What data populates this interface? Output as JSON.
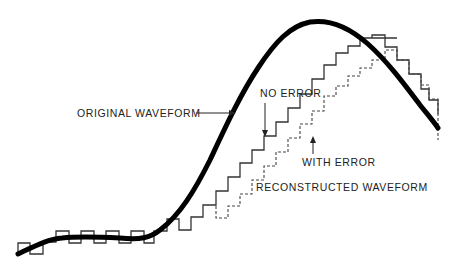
{
  "diagram": {
    "type": "waveform-reconstruction",
    "labels": {
      "original": "ORIGINAL WAVEFORM",
      "no_error": "NO ERROR",
      "with_error": "WITH ERROR",
      "reconstructed": "RECONSTRUCTED WAVEFORM"
    },
    "colors": {
      "background": "#ffffff",
      "original_curve": "#000000",
      "staircase_no_error": "#333333",
      "staircase_with_error": "#555555",
      "text": "#222222"
    },
    "curves": {
      "original_waveform": "thick solid smooth curve",
      "reconstructed_no_error": "solid staircase",
      "reconstructed_with_error": "dashed staircase"
    }
  }
}
